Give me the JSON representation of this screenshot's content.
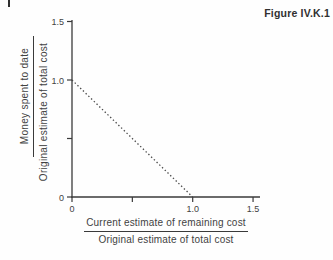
{
  "figure": {
    "label": "Figure IV.K.1"
  },
  "colors": {
    "ink": "#3a3a3a",
    "text": "#424242",
    "background": "#fefefe"
  },
  "chart_data": {
    "type": "line",
    "title": "Figure IV.K.1",
    "xlabel": "Current estimate of remaining cost / Original estimate of total cost",
    "xlabel_numerator": "Current estimate of remaining cost",
    "xlabel_denominator": "Original estimate of total cost",
    "ylabel": "Money spent to date / Original estimate of total cost",
    "ylabel_numerator": "Money spent to date",
    "ylabel_denominator": "Original estimate of total cost",
    "xlim": [
      0,
      1.5
    ],
    "ylim": [
      0,
      1.5
    ],
    "x_ticks": [
      0,
      0.5,
      1.0,
      1.5
    ],
    "x_tick_labels": [
      "0",
      "",
      "1.0",
      "1.5"
    ],
    "y_ticks": [
      0,
      0.5,
      1.0,
      1.5
    ],
    "y_tick_labels": [
      "0",
      "",
      "1.0",
      "1.5"
    ],
    "grid": false,
    "series": [
      {
        "name": "linear-depletion-line",
        "style": "dotted",
        "color": "#4a4a4a",
        "points": [
          [
            0,
            1.0
          ],
          [
            1.0,
            0
          ]
        ]
      }
    ]
  }
}
